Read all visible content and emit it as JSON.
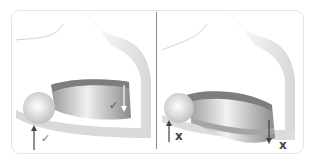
{
  "figure": {
    "panels": [
      {
        "id": "correct",
        "label": "correct position",
        "marks": [
          {
            "type": "arrow-up",
            "symbol": "✓"
          },
          {
            "type": "arrow-down",
            "symbol": "✓"
          }
        ]
      },
      {
        "id": "incorrect",
        "label": "incorrect position",
        "marks": [
          {
            "type": "arrow-up",
            "symbol": "x"
          },
          {
            "type": "arrow-down",
            "symbol": "x"
          }
        ]
      }
    ]
  },
  "colors": {
    "frame_border": "#e4e4e4",
    "divider": "#8a8a8a",
    "collar_dark": "#8c8c8c",
    "collar_light": "#e6e6e6",
    "outline": "#cfcfcf"
  }
}
